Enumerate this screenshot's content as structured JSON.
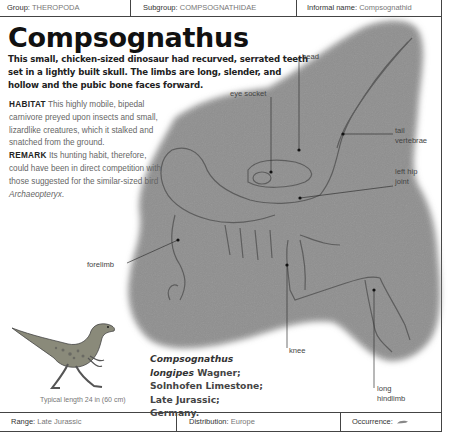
{
  "header": {
    "group_label": "Group:",
    "group_value": "THEROPODA",
    "subgroup_label": "Subgroup:",
    "subgroup_value": "COMPSOGNATHIDAE",
    "informal_label": "Informal name:",
    "informal_value": "Compsognathid"
  },
  "title": "Compsognathus",
  "intro": "This small, chicken-sized dinosaur had recurved, serrated teeth set in a lightly built skull. The limbs are long, slender, and hollow and the pubic bone faces forward.",
  "habitat": {
    "label": "HABITAT",
    "text": "This highly mobile, bipedal carnivore preyed upon insects and small, lizardlike creatures, which it stalked and snatched from the ground."
  },
  "remark": {
    "label": "REMARK",
    "text": "Its hunting habit, therefore, could have been in direct competition with those suggested for the similar-sized bird",
    "italic": "Archaeopteryx",
    "end": "."
  },
  "labels": {
    "head": "head",
    "eye_socket": "eye socket",
    "tail_vertebrae_1": "tail",
    "tail_vertebrae_2": "vertebrae",
    "left_hip_1": "left hip",
    "left_hip_2": "joint",
    "forelimb": "forelimb",
    "knee": "knee",
    "hindlimb_1": "long",
    "hindlimb_2": "hindlimb"
  },
  "illustration_caption": "Typical length 24 in (60 cm)",
  "specimen": {
    "genus": "Compsognathus",
    "species": "longipes",
    "author": " Wagner;",
    "formation": "Solnhofen Limestone;",
    "age_place": "Late Jurassic; Germany."
  },
  "footer": {
    "range_label": "Range:",
    "range_value": "Late Jurassic",
    "distribution_label": "Distribution:",
    "distribution_value": "Europe",
    "occurrence_label": "Occurrence:",
    "occurrence_icon": "shell-fossil-icon"
  },
  "colors": {
    "fossil_slab": "#8f8f8f",
    "rule": "#444444",
    "label_text": "#444444",
    "muted_text": "#777777"
  }
}
